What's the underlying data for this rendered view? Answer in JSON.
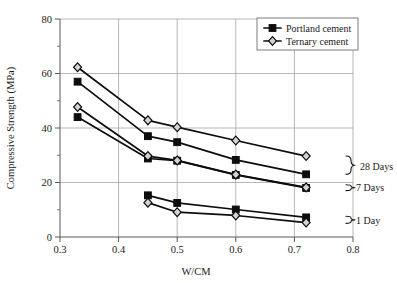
{
  "chart_data": {
    "type": "line",
    "title": "",
    "xlabel": "W/CM",
    "ylabel": "Compressive Strength (MPa)",
    "xlim": [
      0.3,
      0.8
    ],
    "ylim": [
      0,
      80
    ],
    "xticks": [
      "0.3",
      "0.4",
      "0.5",
      "0.6",
      "0.7",
      "0.8"
    ],
    "xtick_values": [
      0.3,
      0.4,
      0.5,
      0.6,
      0.7,
      0.8
    ],
    "yticks": [
      "0",
      "20",
      "40",
      "60",
      "80"
    ],
    "ytick_values": [
      0,
      20,
      40,
      60,
      80
    ],
    "yminor_values": [
      10,
      30,
      50,
      70
    ],
    "grid": "major-xy",
    "legend_position": "top-right",
    "legend": [
      {
        "name": "Portland cement",
        "marker": "filled-square"
      },
      {
        "name": "Ternary cement",
        "marker": "open-diamond"
      }
    ],
    "annotations": [
      {
        "label": "28 Days",
        "x": 0.74,
        "y": 26
      },
      {
        "label": "7 Days",
        "x": 0.74,
        "y": 18
      },
      {
        "label": "1 Day",
        "x": 0.74,
        "y": 6
      }
    ],
    "series": [
      {
        "name": "Portland cement 28 Days",
        "cement": "Portland cement",
        "age": "28 Days",
        "marker": "filled-square",
        "x": [
          0.33,
          0.45,
          0.5,
          0.6,
          0.72
        ],
        "values": [
          57,
          37,
          34.8,
          28.3,
          23
        ]
      },
      {
        "name": "Ternary cement 28 Days",
        "cement": "Ternary cement",
        "age": "28 Days",
        "marker": "open-diamond",
        "x": [
          0.33,
          0.45,
          0.5,
          0.6,
          0.72
        ],
        "values": [
          62.3,
          42.8,
          40.3,
          35.4,
          29.7
        ]
      },
      {
        "name": "Portland cement 7 Days",
        "cement": "Portland cement",
        "age": "7 Days",
        "marker": "filled-square",
        "x": [
          0.33,
          0.45,
          0.5,
          0.6,
          0.72
        ],
        "values": [
          44,
          28.8,
          28,
          22.8,
          18
        ]
      },
      {
        "name": "Ternary cement 7 Days",
        "cement": "Ternary cement",
        "age": "7 Days",
        "marker": "open-diamond",
        "x": [
          0.33,
          0.45,
          0.5,
          0.6,
          0.72
        ],
        "values": [
          47.7,
          29.7,
          28.1,
          22.9,
          18.2
        ]
      },
      {
        "name": "Portland cement 1 Day",
        "cement": "Portland cement",
        "age": "1 Day",
        "marker": "filled-square",
        "x": [
          0.45,
          0.5,
          0.6,
          0.72
        ],
        "values": [
          15.3,
          12.5,
          10.1,
          7.2
        ]
      },
      {
        "name": "Ternary cement 1 Day",
        "cement": "Ternary cement",
        "age": "1 Day",
        "marker": "open-diamond",
        "x": [
          0.45,
          0.5,
          0.6,
          0.72
        ],
        "values": [
          12.6,
          9.1,
          7.9,
          5.3
        ]
      }
    ]
  },
  "colors": {
    "line": "#0d0d0d",
    "grid": "#9a9a9a",
    "axis": "#595959",
    "marker_fill_open": "#d3d3d3",
    "background": "#ffffff"
  }
}
